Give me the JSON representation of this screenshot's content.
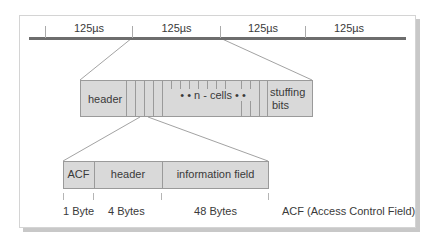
{
  "timeline": {
    "slots": [
      "125µs",
      "125µs",
      "125µs",
      "125µs"
    ]
  },
  "frame_bar": {
    "header": "header",
    "cells_label": "• • n - cells • •",
    "stuffing_line1": "stuffing",
    "stuffing_line2": "bits"
  },
  "cell_bar": {
    "acf": "ACF",
    "header": "header",
    "info": "information field"
  },
  "sizes": {
    "acf": "1 Byte",
    "header": "4 Bytes",
    "info": "48 Bytes"
  },
  "legend": "ACF (Access Control Field)",
  "colors": {
    "box_fill": "#d9d9d9",
    "box_border": "#9a9a9a",
    "timeline": "#6d6d6d"
  }
}
